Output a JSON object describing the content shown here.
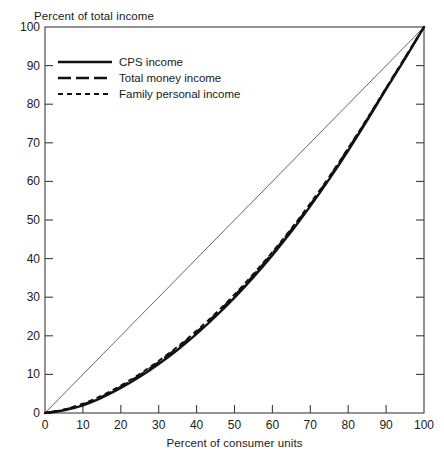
{
  "chart_data": {
    "type": "line",
    "title": "",
    "xlabel": "Percent of consumer units",
    "ylabel": "Percent of total income",
    "xlim": [
      0,
      100
    ],
    "ylim": [
      0,
      100
    ],
    "grid": false,
    "legend_position": "upper-left",
    "xticks": [
      0,
      10,
      20,
      30,
      40,
      50,
      60,
      70,
      80,
      90,
      100
    ],
    "yticks": [
      0,
      10,
      20,
      30,
      40,
      50,
      60,
      70,
      80,
      90,
      100
    ],
    "xtick_labels": [
      "0",
      "10",
      "20",
      "30",
      "40",
      "50",
      "60",
      "70",
      "80",
      "90",
      "100"
    ],
    "ytick_labels": [
      "0",
      "10",
      "20",
      "30",
      "40",
      "50",
      "60",
      "70",
      "80",
      "90",
      "100"
    ],
    "reference_line": {
      "name": "line-of-equality",
      "x": [
        0,
        100
      ],
      "y": [
        0,
        100
      ],
      "style": "solid-thin"
    },
    "x": [
      0,
      5,
      10,
      15,
      20,
      25,
      30,
      35,
      40,
      45,
      50,
      55,
      60,
      65,
      70,
      75,
      80,
      85,
      90,
      95,
      100
    ],
    "series": [
      {
        "name": "CPS income",
        "style": "solid",
        "values": [
          0,
          0.7,
          2.0,
          4.0,
          6.5,
          9.4,
          12.7,
          16.4,
          20.5,
          25.0,
          29.9,
          35.2,
          40.9,
          47.0,
          53.6,
          60.6,
          68.0,
          75.8,
          83.9,
          91.8,
          100
        ]
      },
      {
        "name": "Total money income",
        "style": "long-dash",
        "values": [
          0,
          0.8,
          2.2,
          4.2,
          6.8,
          9.8,
          13.2,
          16.9,
          21.0,
          25.5,
          30.4,
          35.7,
          41.4,
          47.5,
          54.0,
          61.0,
          68.4,
          76.1,
          84.1,
          92.0,
          100
        ]
      },
      {
        "name": "Family personal income",
        "style": "short-dash",
        "values": [
          0,
          0.9,
          2.4,
          4.5,
          7.1,
          10.1,
          13.5,
          17.2,
          21.3,
          25.8,
          30.7,
          36.0,
          41.7,
          47.8,
          54.3,
          61.2,
          68.6,
          76.3,
          84.2,
          92.1,
          100
        ]
      }
    ]
  },
  "legend": {
    "items": [
      {
        "label": "CPS income"
      },
      {
        "label": "Total money income"
      },
      {
        "label": "Family personal income"
      }
    ]
  }
}
